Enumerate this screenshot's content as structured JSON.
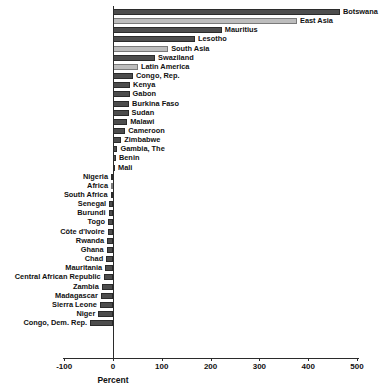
{
  "chart_data": {
    "type": "bar",
    "orientation": "horizontal",
    "title": "",
    "xlabel": "Percent",
    "ylabel": "",
    "xlim": [
      -100,
      500
    ],
    "xticks": [
      -100,
      0,
      100,
      200,
      300,
      400,
      500
    ],
    "xticklabels": [
      "-100",
      "0",
      "100",
      "200",
      "300",
      "400",
      "500"
    ],
    "grid": false,
    "legend": false,
    "colors": {
      "country_bar": "#4d4d4d",
      "region_bar": "#bdbdbd",
      "axis": "#2b2b2b",
      "background": "#ffffff"
    },
    "categories": [
      "Botswana",
      "East Asia",
      "Mauritius",
      "Lesotho",
      "South Asia",
      "Swaziland",
      "Latin America",
      "Congo, Rep.",
      "Kenya",
      "Gabon",
      "Burkina Faso",
      "Sudan",
      "Malawi",
      "Cameroon",
      "Zimbabwe",
      "Gambia, The",
      "Benin",
      "Mali",
      "Nigeria",
      "Africa",
      "South Africa",
      "Senegal",
      "Burundi",
      "Togo",
      "Côte d'Ivoire",
      "Rwanda",
      "Ghana",
      "Chad",
      "Mauritania",
      "Central African Republic",
      "Zambia",
      "Madagascar",
      "Sierra Leone",
      "Niger",
      "Congo, Dem. Rep."
    ],
    "values": [
      465,
      377,
      223,
      168,
      113,
      86,
      51,
      41,
      35,
      34,
      33,
      32,
      29,
      25,
      17,
      9,
      6,
      4,
      -1,
      -3,
      -5,
      -8,
      -9,
      -10,
      -11,
      -12,
      -13,
      -14,
      -16,
      -19,
      -23,
      -25,
      -27,
      -30,
      -47
    ],
    "series_kinds": [
      "country",
      "region",
      "country",
      "country",
      "region",
      "country",
      "region",
      "country",
      "country",
      "country",
      "country",
      "country",
      "country",
      "country",
      "country",
      "country",
      "country",
      "country",
      "country",
      "region",
      "country",
      "country",
      "country",
      "country",
      "country",
      "country",
      "country",
      "country",
      "country",
      "country",
      "country",
      "country",
      "country",
      "country",
      "country"
    ]
  }
}
